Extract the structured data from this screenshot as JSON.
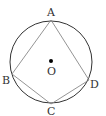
{
  "diagram": {
    "type": "inscribed-quadrilateral",
    "circle": {
      "cx": 51,
      "cy": 62,
      "r": 41,
      "stroke": "#333333"
    },
    "center": {
      "label": "O",
      "x": 51,
      "y": 61
    },
    "points": {
      "A": {
        "label": "A",
        "x": 51,
        "y": 20
      },
      "B": {
        "label": "B",
        "x": 12,
        "y": 74
      },
      "C": {
        "label": "C",
        "x": 51,
        "y": 104
      },
      "D": {
        "label": "D",
        "x": 89,
        "y": 80
      }
    },
    "segments": [
      "AB",
      "BC",
      "CD",
      "DA"
    ],
    "line_color": "#888888"
  }
}
